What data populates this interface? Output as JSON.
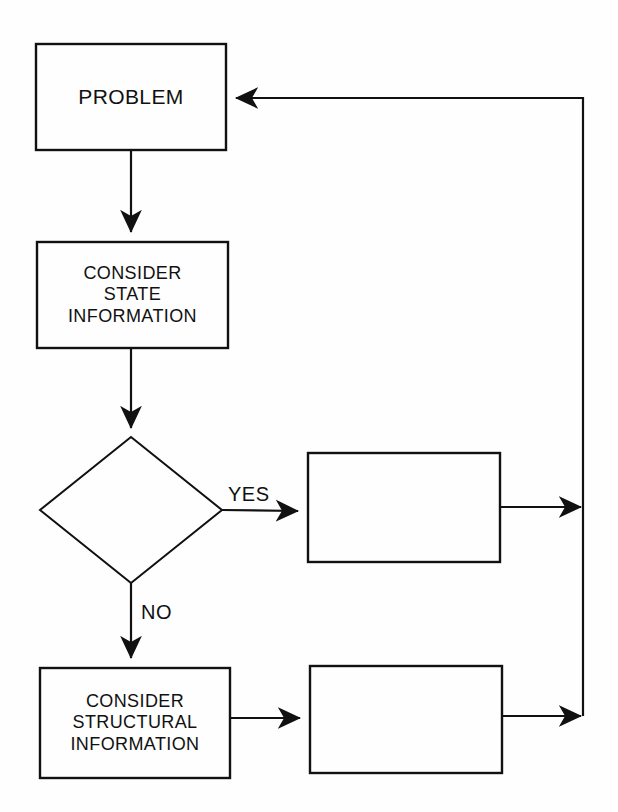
{
  "diagram": {
    "type": "flowchart",
    "background_color": "#fefefe",
    "stroke_color": "#111111",
    "text_color": "#111111"
  },
  "nodes": {
    "problem": {
      "label": "PROBLEM",
      "lines": [
        "PROBLEM"
      ],
      "shape": "rectangle",
      "font_size": 21,
      "x": 36,
      "y": 44,
      "width": 190,
      "height": 106
    },
    "consider_state": {
      "label": "CONSIDER STATE INFORMATION",
      "lines": [
        "CONSIDER",
        "STATE",
        "INFORMATION"
      ],
      "shape": "rectangle",
      "font_size": 18,
      "x": 37,
      "y": 242,
      "width": 191,
      "height": 106
    },
    "decision": {
      "label": "",
      "lines": [],
      "shape": "diamond",
      "font_size": 18,
      "cx": 131,
      "cy": 510,
      "rx": 91,
      "ry": 73
    },
    "yes_result": {
      "label": "",
      "lines": [],
      "shape": "rectangle",
      "font_size": 18,
      "x": 308,
      "y": 453,
      "width": 192,
      "height": 109
    },
    "consider_structural": {
      "label": "CONSIDER STRUCTURAL INFORMATION",
      "lines": [
        "CONSIDER",
        "STRUCTURAL",
        "INFORMATION"
      ],
      "shape": "rectangle",
      "font_size": 18,
      "x": 40,
      "y": 668,
      "width": 190,
      "height": 110
    },
    "no_result": {
      "label": "",
      "lines": [],
      "shape": "rectangle",
      "font_size": 18,
      "x": 310,
      "y": 666,
      "width": 192,
      "height": 107
    }
  },
  "edge_labels": {
    "yes": "YES",
    "no": "NO"
  },
  "edges": [
    {
      "name": "problem-to-consider-state",
      "from": "problem",
      "to": "consider_state",
      "label": ""
    },
    {
      "name": "consider-state-to-decision",
      "from": "consider_state",
      "to": "decision",
      "label": ""
    },
    {
      "name": "decision-yes-to-yes-result",
      "from": "decision",
      "to": "yes_result",
      "label": "YES"
    },
    {
      "name": "decision-no-to-consider-structural",
      "from": "decision",
      "to": "consider_structural",
      "label": "NO"
    },
    {
      "name": "consider-structural-to-no-result",
      "from": "consider_structural",
      "to": "no_result",
      "label": ""
    },
    {
      "name": "yes-result-to-feedback-trunk",
      "from": "yes_result",
      "to": "feedback_trunk",
      "label": ""
    },
    {
      "name": "no-result-to-feedback-trunk",
      "from": "no_result",
      "to": "feedback_trunk",
      "label": ""
    },
    {
      "name": "feedback-trunk-to-problem",
      "from": "feedback_trunk",
      "to": "problem",
      "label": ""
    }
  ],
  "geometry": {
    "feedback_trunk_x": 583,
    "feedback_top_y": 98,
    "feedback_bottom_y": 716,
    "yes_branch_y": 512,
    "no_branch_x": 131,
    "yes_label_pos": {
      "x": 228,
      "y": 483
    },
    "no_label_pos": {
      "x": 141,
      "y": 601
    }
  }
}
